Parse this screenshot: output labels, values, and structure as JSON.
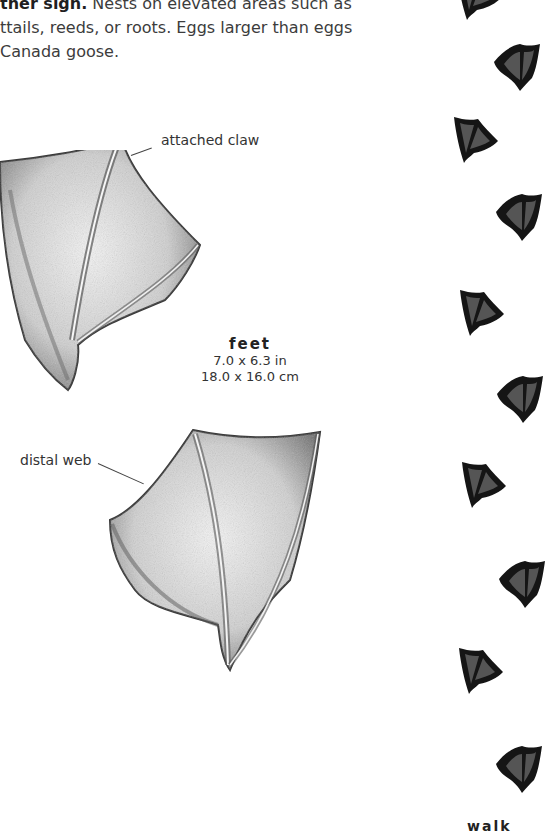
{
  "paragraph": {
    "lead_bold": "ther sign.",
    "line1_rest": " Nests on elevated areas such as",
    "line2": "ttails, reeds, or roots. Eggs larger than eggs",
    "line3": " Canada goose."
  },
  "illustration": {
    "callouts": {
      "attached_claw": "attached claw",
      "distal_web": "distal web"
    },
    "caption": {
      "title": "feet",
      "dim_in": "7.0 x 6.3 in",
      "dim_cm": "18.0 x 16.0 cm"
    }
  },
  "trackway": {
    "label": "walk",
    "print_color": "#151515",
    "prints": [
      {
        "side": "left",
        "x": 455,
        "y": -30
      },
      {
        "side": "right",
        "x": 492,
        "y": 40
      },
      {
        "side": "left",
        "x": 452,
        "y": 113
      },
      {
        "side": "right",
        "x": 494,
        "y": 190
      },
      {
        "side": "left",
        "x": 458,
        "y": 286
      },
      {
        "side": "right",
        "x": 495,
        "y": 372
      },
      {
        "side": "left",
        "x": 460,
        "y": 458
      },
      {
        "side": "right",
        "x": 497,
        "y": 557
      },
      {
        "side": "left",
        "x": 457,
        "y": 644
      },
      {
        "side": "right",
        "x": 494,
        "y": 742
      }
    ]
  }
}
